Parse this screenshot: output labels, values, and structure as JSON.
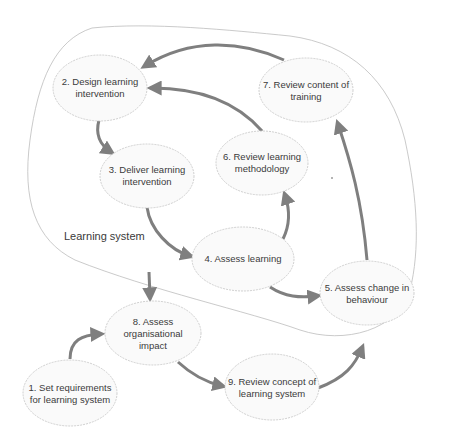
{
  "diagram": {
    "boundary_label": "Learning system",
    "colors": {
      "arrow": "#7f7f7f",
      "node_fill": "#fafafa",
      "node_stroke": "#c4c4c4",
      "text": "#3a3a3a"
    },
    "nodes": [
      {
        "id": "1",
        "line1": "1. Set requirements",
        "line2": "for learning system",
        "line3": ""
      },
      {
        "id": "2",
        "line1": "2. Design learning",
        "line2": "intervention",
        "line3": ""
      },
      {
        "id": "3",
        "line1": "3. Deliver learning",
        "line2": "intervention",
        "line3": ""
      },
      {
        "id": "4",
        "line1": "4. Assess learning",
        "line2": "",
        "line3": ""
      },
      {
        "id": "5",
        "line1": "5. Assess change in",
        "line2": "behaviour",
        "line3": ""
      },
      {
        "id": "6",
        "line1": "6. Review learning",
        "line2": "methodology",
        "line3": ""
      },
      {
        "id": "7",
        "line1": "7. Review content of",
        "line2": "training",
        "line3": ""
      },
      {
        "id": "8",
        "line1": "8. Assess",
        "line2": "organisational",
        "line3": "impact"
      },
      {
        "id": "9",
        "line1": "9. Review concept of",
        "line2": "learning system",
        "line3": ""
      }
    ],
    "edges": [
      {
        "from": "1",
        "to": "8"
      },
      {
        "from": "2",
        "to": "3"
      },
      {
        "from": "3",
        "to": "4"
      },
      {
        "from": "4",
        "to": "6"
      },
      {
        "from": "4",
        "to": "5"
      },
      {
        "from": "6",
        "to": "2"
      },
      {
        "from": "7",
        "to": "2"
      },
      {
        "from": "5",
        "to": "7"
      },
      {
        "from": "learning-system",
        "to": "8"
      },
      {
        "from": "8",
        "to": "9"
      },
      {
        "from": "9",
        "to": "learning-system"
      }
    ]
  }
}
